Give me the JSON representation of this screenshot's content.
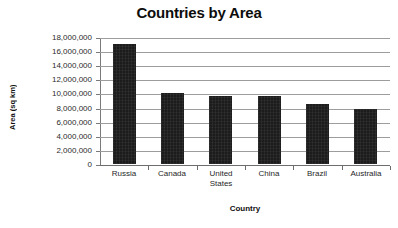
{
  "chart_data": {
    "type": "bar",
    "title": "Countries by Area",
    "xlabel": "Country",
    "ylabel": "Area (sq km)",
    "categories": [
      "Russia",
      "Canada",
      "United States",
      "China",
      "Brazil",
      "Australia"
    ],
    "values": [
      17000000,
      10000000,
      9600000,
      9650000,
      8500000,
      7750000
    ],
    "ylim": [
      0,
      18000000
    ],
    "ytick_labels": [
      "18,000,000",
      "16,000,000",
      "14,000,000",
      "12,000,000",
      "10,000,000",
      "8,000,000",
      "6,000,000",
      "4,000,000",
      "2,000,000",
      "0"
    ],
    "ytick_values": [
      18000000,
      16000000,
      14000000,
      12000000,
      10000000,
      8000000,
      6000000,
      4000000,
      2000000,
      0
    ],
    "grid": true,
    "grid_axis": "y",
    "legend": false,
    "series": [
      {
        "name": "Area (sq km)",
        "color": "#1c1c1c",
        "values": [
          17000000,
          10000000,
          9600000,
          9650000,
          8500000,
          7750000
        ]
      }
    ]
  },
  "colors": {
    "bar": "#1c1c1c",
    "gridline": "#9d9d9d",
    "axis": "#6d6d6d",
    "background": "#ffffff",
    "text": "#1a1a1a"
  }
}
